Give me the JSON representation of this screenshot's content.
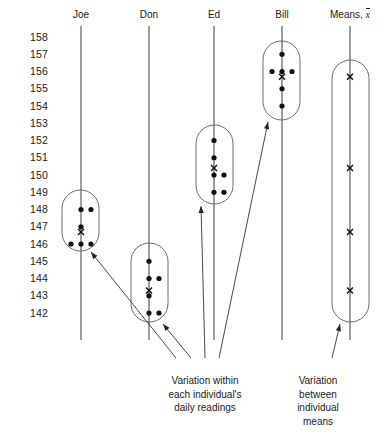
{
  "figure": {
    "headers": [
      {
        "label": "Joe",
        "x": 81
      },
      {
        "label": "Don",
        "x": 149
      },
      {
        "label": "Ed",
        "x": 214
      },
      {
        "label": "Bill",
        "x": 282
      },
      {
        "label": "Means, ",
        "x": 350,
        "suffix": "x"
      }
    ],
    "annotations": [
      {
        "name": "within",
        "text": "Variation within\neach individual's\ndaily readings",
        "x": 205,
        "y": 374
      },
      {
        "name": "between",
        "text": "Variation between\nindividual means",
        "x": 318,
        "y": 374
      }
    ]
  },
  "chart_data": {
    "type": "scatter",
    "title": "",
    "xlabel": "",
    "ylabel": "",
    "ylim": [
      142,
      158
    ],
    "grid": false,
    "legend": "none",
    "ytick_labels": [
      158,
      157,
      156,
      155,
      154,
      153,
      152,
      151,
      150,
      149,
      148,
      147,
      146,
      145,
      144,
      143,
      142
    ],
    "categories": [
      "Joe",
      "Don",
      "Ed",
      "Bill",
      "Means"
    ],
    "series": [
      {
        "name": "Joe",
        "axis_x": 81,
        "points": [
          {
            "value": 148,
            "offsets": [
              0,
              10
            ]
          },
          {
            "value": 147,
            "offsets": [
              0
            ]
          },
          {
            "value": 146,
            "offsets": [
              -10,
              0,
              10
            ]
          }
        ],
        "mean": 146.7,
        "capsule": {
          "x": 62,
          "y": 190,
          "w": 37,
          "h": 61
        }
      },
      {
        "name": "Don",
        "axis_x": 149,
        "points": [
          {
            "value": 145,
            "offsets": [
              0
            ]
          },
          {
            "value": 144,
            "offsets": [
              0,
              10
            ]
          },
          {
            "value": 143,
            "offsets": [
              0
            ]
          },
          {
            "value": 142,
            "offsets": [
              0,
              10
            ]
          }
        ],
        "mean": 143.3,
        "capsule": {
          "x": 131,
          "y": 243,
          "w": 37,
          "h": 79
        }
      },
      {
        "name": "Ed",
        "axis_x": 214,
        "points": [
          {
            "value": 152,
            "offsets": [
              0
            ]
          },
          {
            "value": 151,
            "offsets": [
              0
            ]
          },
          {
            "value": 150,
            "offsets": [
              0,
              10
            ]
          },
          {
            "value": 149,
            "offsets": [
              0,
              10
            ]
          }
        ],
        "mean": 150.4,
        "capsule": {
          "x": 196,
          "y": 125,
          "w": 37,
          "h": 79
        }
      },
      {
        "name": "Bill",
        "axis_x": 282,
        "points": [
          {
            "value": 157,
            "offsets": [
              0
            ]
          },
          {
            "value": 156,
            "offsets": [
              -10,
              0,
              10
            ]
          },
          {
            "value": 155,
            "offsets": [
              0
            ]
          },
          {
            "value": 154,
            "offsets": [
              0
            ]
          }
        ],
        "mean": 155.7,
        "capsule": {
          "x": 263,
          "y": 41,
          "w": 37,
          "h": 79
        }
      },
      {
        "name": "Means",
        "axis_x": 350,
        "points": [],
        "means": [
          155.7,
          150.4,
          146.7,
          143.3
        ],
        "capsule": {
          "x": 332,
          "y": 60,
          "w": 37,
          "h": 262
        }
      }
    ],
    "arrows": [
      {
        "name": "arrow-to-joe",
        "from": [
          176,
          358
        ],
        "to": [
          91,
          252
        ]
      },
      {
        "name": "arrow-to-don",
        "from": [
          191,
          358
        ],
        "to": [
          163,
          324
        ]
      },
      {
        "name": "arrow-to-ed",
        "from": [
          205,
          358
        ],
        "to": [
          201,
          206
        ]
      },
      {
        "name": "arrow-to-bill",
        "from": [
          219,
          358
        ],
        "to": [
          268,
          122
        ]
      },
      {
        "name": "arrow-to-means",
        "from": [
          332,
          358
        ],
        "to": [
          340,
          324
        ]
      }
    ]
  }
}
